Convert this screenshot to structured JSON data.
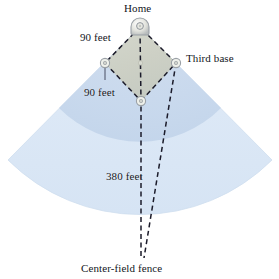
{
  "figure": {
    "type": "baseball-field-diagram",
    "labels": {
      "home": "Home",
      "third_base": "Third base",
      "baseline_a": "90 feet",
      "baseline_b": "90 feet",
      "center_field_distance": "380 feet",
      "center_field_fence": "Center-field fence"
    },
    "measurements": {
      "baseline_feet": 90,
      "center_field_feet": 380
    },
    "colors": {
      "outfield": "#dde9f6",
      "outfield_edge": "#cddff1",
      "infield_arc": "#c7d9ee",
      "diamond_fill": "#cfd2c4",
      "dash_line": "#1b1b2a",
      "base_fill": "#f3f4ef",
      "base_stroke": "#9aa0a6",
      "text": "#13161c"
    },
    "bases": [
      {
        "name": "home-plate",
        "x": 140,
        "y": 27
      },
      {
        "name": "first-base",
        "x": 176,
        "y": 63
      },
      {
        "name": "second-base",
        "x": 141,
        "y": 101
      },
      {
        "name": "third-base-marker",
        "x": 105,
        "y": 63
      }
    ]
  }
}
